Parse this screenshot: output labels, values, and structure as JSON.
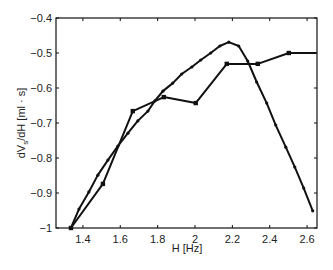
{
  "chart_data": {
    "type": "line",
    "title": "",
    "xlabel": "H [Hz]",
    "ylabel": "dVₛ/dH [ml · s]",
    "ylabel_main": "dV",
    "ylabel_sub": "s",
    "ylabel_rest": "/dH [ml · s]",
    "xlim": [
      1.256,
      2.653
    ],
    "ylim": [
      -1.0,
      -0.4
    ],
    "grid": false,
    "legend": null,
    "xticks": [
      1.4,
      1.6,
      1.8,
      2.0,
      2.2,
      2.4,
      2.6
    ],
    "xtick_labels": [
      "1.4",
      "1.6",
      "1.8",
      "2",
      "2.2",
      "2.4",
      "2.6"
    ],
    "yticks": [
      -1.0,
      -0.9,
      -0.8,
      -0.7,
      -0.6,
      -0.5,
      -0.4
    ],
    "ytick_labels": [
      "−1",
      "−0.9",
      "−0.8",
      "−0.7",
      "−0.6",
      "−0.5",
      "−0.4"
    ],
    "series": [
      {
        "name": "coarse (square markers)",
        "marker": "square",
        "color": "#111111",
        "x": [
          1.336,
          1.507,
          1.667,
          1.833,
          2.004,
          2.17,
          2.336,
          2.502,
          2.651
        ],
        "y": [
          -1.0,
          -0.874,
          -0.666,
          -0.626,
          -0.643,
          -0.531,
          -0.531,
          -0.5,
          -0.5
        ]
      },
      {
        "name": "fine (dot markers)",
        "marker": "dot",
        "color": "#111111",
        "x": [
          1.336,
          1.379,
          1.432,
          1.48,
          1.534,
          1.587,
          1.641,
          1.694,
          1.748,
          1.785,
          1.828,
          1.881,
          1.929,
          1.983,
          2.031,
          2.084,
          2.133,
          2.181,
          2.234,
          2.282,
          2.33,
          2.384,
          2.432,
          2.486,
          2.534,
          2.582,
          2.63
        ],
        "y": [
          -1.0,
          -0.946,
          -0.897,
          -0.849,
          -0.806,
          -0.766,
          -0.729,
          -0.694,
          -0.666,
          -0.637,
          -0.609,
          -0.586,
          -0.56,
          -0.54,
          -0.52,
          -0.5,
          -0.48,
          -0.469,
          -0.48,
          -0.523,
          -0.583,
          -0.643,
          -0.706,
          -0.769,
          -0.826,
          -0.886,
          -0.951
        ]
      }
    ]
  }
}
